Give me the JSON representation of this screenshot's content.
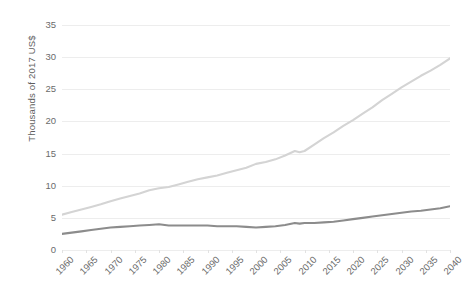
{
  "chart_data": {
    "type": "line",
    "title": "",
    "xlabel": "",
    "ylabel": "Thousands of 2017 US$",
    "xlim": [
      1960,
      2040
    ],
    "ylim": [
      0,
      35
    ],
    "ytick_step": 5,
    "xtick_step": 5,
    "grid": true,
    "legend": "none",
    "yticks": [
      "0",
      "5",
      "10",
      "15",
      "20",
      "25",
      "30",
      "35"
    ],
    "xticks": [
      "1960",
      "1965",
      "1970",
      "1975",
      "1980",
      "1985",
      "1990",
      "1995",
      "2000",
      "2005",
      "2010",
      "2015",
      "2020",
      "2025",
      "2030",
      "2035",
      "2040"
    ],
    "colors": {
      "series_light": "#d4d4d4",
      "series_dark": "#8c8c8c",
      "gridline": "#ededed",
      "tick_text": "#6b6b6b",
      "axis_title": "#5e5e5e"
    },
    "x": [
      1960,
      1962,
      1964,
      1966,
      1968,
      1970,
      1972,
      1974,
      1976,
      1978,
      1980,
      1982,
      1984,
      1986,
      1988,
      1990,
      1992,
      1994,
      1996,
      1998,
      2000,
      2002,
      2004,
      2006,
      2008,
      2009,
      2010,
      2012,
      2014,
      2016,
      2018,
      2020,
      2022,
      2024,
      2026,
      2028,
      2030,
      2032,
      2034,
      2036,
      2038,
      2040
    ],
    "series": [
      {
        "name": "series-light",
        "color": "#d4d4d4",
        "values": [
          5.5,
          5.9,
          6.3,
          6.7,
          7.1,
          7.6,
          8.0,
          8.4,
          8.8,
          9.3,
          9.6,
          9.8,
          10.2,
          10.6,
          11.0,
          11.3,
          11.6,
          12.0,
          12.4,
          12.8,
          13.4,
          13.7,
          14.1,
          14.7,
          15.4,
          15.2,
          15.4,
          16.4,
          17.4,
          18.3,
          19.3,
          20.2,
          21.2,
          22.2,
          23.3,
          24.3,
          25.3,
          26.2,
          27.1,
          27.9,
          28.8,
          29.8
        ]
      },
      {
        "name": "series-dark",
        "color": "#8c8c8c",
        "values": [
          2.5,
          2.7,
          2.9,
          3.1,
          3.3,
          3.5,
          3.6,
          3.7,
          3.8,
          3.9,
          4.0,
          3.8,
          3.8,
          3.8,
          3.8,
          3.8,
          3.7,
          3.7,
          3.7,
          3.6,
          3.5,
          3.6,
          3.7,
          3.9,
          4.2,
          4.1,
          4.2,
          4.2,
          4.3,
          4.4,
          4.6,
          4.8,
          5.0,
          5.2,
          5.4,
          5.6,
          5.8,
          6.0,
          6.1,
          6.3,
          6.5,
          6.8
        ]
      }
    ]
  }
}
